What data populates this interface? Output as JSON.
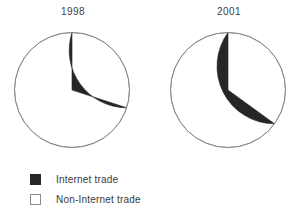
{
  "chart_data": {
    "type": "pie",
    "title": "",
    "subtitle": "",
    "xlabel": "",
    "ylabel": "",
    "grid": false,
    "legend_position": "bottom-left",
    "categories": [
      "Internet trade",
      "Non-Internet trade"
    ],
    "colors": {
      "internet_trade": "#262626",
      "non_internet_trade": "#ffffff",
      "outline": "#8a8a8a",
      "text": "#3a3a3a"
    },
    "charts": [
      {
        "name": "pie-1998",
        "title": "1998",
        "start_angle_deg": 0,
        "direction": "counterclockwise",
        "slices": [
          {
            "label": "Internet trade",
            "value": 30,
            "unit": "%",
            "color": "#262626",
            "angle_deg": 108
          },
          {
            "label": "Non-Internet trade",
            "value": 70,
            "unit": "%",
            "color": "#ffffff",
            "angle_deg": 252
          }
        ]
      },
      {
        "name": "pie-2001",
        "title": "2001",
        "start_angle_deg": 0,
        "direction": "counterclockwise",
        "slices": [
          {
            "label": "Internet trade",
            "value": 35,
            "unit": "%",
            "color": "#262626",
            "angle_deg": 126
          },
          {
            "label": "Non-Internet trade",
            "value": 65,
            "unit": "%",
            "color": "#ffffff",
            "angle_deg": 234
          }
        ]
      }
    ]
  },
  "charts": {
    "first": {
      "title": "1998"
    },
    "second": {
      "title": "2001"
    }
  },
  "legend": {
    "items": [
      {
        "label": "Internet trade",
        "swatch": "filled"
      },
      {
        "label": "Non-Internet trade",
        "swatch": "hollow"
      }
    ]
  }
}
